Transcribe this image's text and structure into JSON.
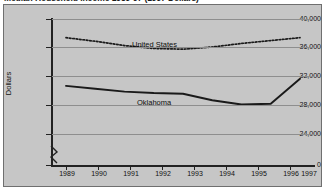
{
  "title": "Median Household Income 1989-97 (1997 Dollars)",
  "axis": {
    "ylabel": "Dollars",
    "yticks": [
      "0",
      "24,000",
      "28,000",
      "32,000",
      "36,000",
      "40,000"
    ],
    "xticks": [
      "1989",
      "1990",
      "1991",
      "1992",
      "1993",
      "1994",
      "1995",
      "1996",
      "1997"
    ]
  },
  "labels": {
    "united_states": "United States",
    "oklahoma": "Oklahoma"
  },
  "colors": {
    "panel_background": "#c6c6c6",
    "frame": "#6f6f6f",
    "gridline": "#8e8e8e",
    "axis": "#222222",
    "series_united_states": "#1a1a1a",
    "series_oklahoma": "#1a1a1a"
  },
  "chart_data": {
    "type": "line",
    "title": "Median Household Income 1989-97 (1997 Dollars)",
    "xlabel": "",
    "ylabel": "Dollars",
    "x": [
      1989,
      1990,
      1991,
      1992,
      1993,
      1994,
      1995,
      1996,
      1997
    ],
    "ylim": [
      24000,
      40000
    ],
    "y_axis_break_below": 24000,
    "grid": true,
    "legend": "inline-annotations",
    "series": [
      {
        "name": "United States",
        "style": "dotted",
        "values": [
          37400,
          36900,
          36300,
          35900,
          35800,
          36100,
          36600,
          37000,
          37400
        ]
      },
      {
        "name": "Oklahoma",
        "style": "solid",
        "values": [
          30700,
          30300,
          29900,
          29700,
          29600,
          28700,
          28100,
          28200,
          31700
        ]
      }
    ]
  }
}
